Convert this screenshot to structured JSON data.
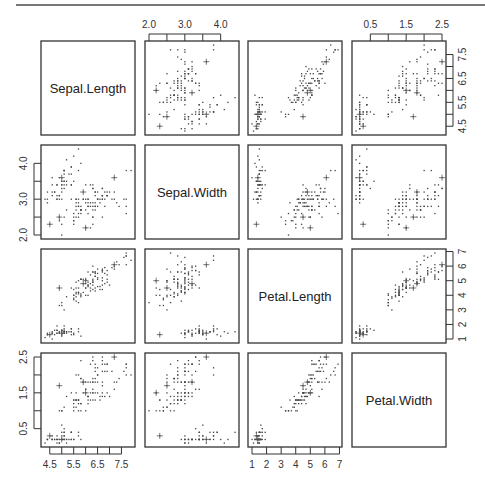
{
  "chart_data": {
    "type": "scatter",
    "title": "",
    "subtype": "scatterplot-matrix",
    "variables": [
      "Sepal.Length",
      "Sepal.Width",
      "Petal.Length",
      "Petal.Width"
    ],
    "ranges": {
      "Sepal.Length": [
        4.3,
        7.9
      ],
      "Sepal.Width": [
        2.0,
        4.4
      ],
      "Petal.Length": [
        1.0,
        6.9
      ],
      "Petal.Width": [
        0.1,
        2.5
      ]
    },
    "axes": {
      "top": [
        {
          "column": 1,
          "variable": "Sepal.Width",
          "ticks": [
            "2.0",
            "3.0",
            "4.0"
          ],
          "tick_values": [
            2.0,
            2.5,
            3.0,
            3.5,
            4.0
          ]
        },
        {
          "column": 3,
          "variable": "Petal.Width",
          "ticks": [
            "0.5",
            "1.5",
            "2.5"
          ],
          "tick_values": [
            0.5,
            1.0,
            1.5,
            2.0,
            2.5
          ]
        }
      ],
      "right": [
        {
          "row": 0,
          "variable": "Sepal.Length",
          "ticks": [
            "4.5",
            "5.5",
            "6.5",
            "7.5"
          ],
          "tick_values": [
            4.5,
            5.0,
            5.5,
            6.0,
            6.5,
            7.0,
            7.5
          ]
        },
        {
          "row": 2,
          "variable": "Petal.Length",
          "ticks": [
            "1",
            "2",
            "3",
            "4",
            "5",
            "6",
            "7"
          ],
          "tick_values": [
            1,
            2,
            3,
            4,
            5,
            6,
            7
          ]
        }
      ],
      "left": [
        {
          "row": 1,
          "variable": "Sepal.Width",
          "ticks": [
            "2.0",
            "3.0",
            "4.0"
          ],
          "tick_values": [
            2.0,
            2.5,
            3.0,
            3.5,
            4.0
          ]
        },
        {
          "row": 3,
          "variable": "Petal.Width",
          "ticks": [
            "0.5",
            "1.5",
            "2.5"
          ],
          "tick_values": [
            0.5,
            1.0,
            1.5,
            2.0,
            2.5
          ]
        }
      ],
      "bottom": [
        {
          "column": 0,
          "variable": "Sepal.Length",
          "ticks": [
            "4.5",
            "5.5",
            "6.5",
            "7.5"
          ],
          "tick_values": [
            4.5,
            5.0,
            5.5,
            6.0,
            6.5,
            7.0,
            7.5
          ]
        },
        {
          "column": 2,
          "variable": "Petal.Length",
          "ticks": [
            "1",
            "2",
            "3",
            "4",
            "5",
            "6",
            "7"
          ],
          "tick_values": [
            1,
            2,
            3,
            4,
            5,
            6,
            7
          ]
        }
      ]
    },
    "points": [
      [
        5.1,
        3.5,
        1.4,
        0.2
      ],
      [
        4.9,
        3.0,
        1.4,
        0.2
      ],
      [
        4.7,
        3.2,
        1.3,
        0.2
      ],
      [
        4.6,
        3.1,
        1.5,
        0.2
      ],
      [
        5.0,
        3.6,
        1.4,
        0.2
      ],
      [
        5.4,
        3.9,
        1.7,
        0.4
      ],
      [
        4.6,
        3.4,
        1.4,
        0.3
      ],
      [
        5.0,
        3.4,
        1.5,
        0.2
      ],
      [
        4.4,
        2.9,
        1.4,
        0.2
      ],
      [
        4.9,
        3.1,
        1.5,
        0.1
      ],
      [
        5.4,
        3.7,
        1.5,
        0.2
      ],
      [
        4.8,
        3.4,
        1.6,
        0.2
      ],
      [
        4.8,
        3.0,
        1.4,
        0.1
      ],
      [
        4.3,
        3.0,
        1.1,
        0.1
      ],
      [
        5.8,
        4.0,
        1.2,
        0.2
      ],
      [
        5.7,
        4.4,
        1.5,
        0.4
      ],
      [
        5.4,
        3.9,
        1.3,
        0.4
      ],
      [
        5.1,
        3.5,
        1.4,
        0.3
      ],
      [
        5.7,
        3.8,
        1.7,
        0.3
      ],
      [
        5.1,
        3.8,
        1.5,
        0.3
      ],
      [
        5.4,
        3.4,
        1.7,
        0.2
      ],
      [
        5.1,
        3.7,
        1.5,
        0.4
      ],
      [
        4.6,
        3.6,
        1.0,
        0.2
      ],
      [
        5.1,
        3.3,
        1.7,
        0.5
      ],
      [
        4.8,
        3.4,
        1.9,
        0.2
      ],
      [
        5.0,
        3.0,
        1.6,
        0.2
      ],
      [
        5.0,
        3.4,
        1.6,
        0.4
      ],
      [
        5.2,
        3.5,
        1.5,
        0.2
      ],
      [
        5.2,
        3.4,
        1.4,
        0.2
      ],
      [
        4.7,
        3.2,
        1.6,
        0.2
      ],
      [
        4.8,
        3.1,
        1.6,
        0.2
      ],
      [
        5.4,
        3.4,
        1.5,
        0.4
      ],
      [
        5.2,
        4.1,
        1.5,
        0.1
      ],
      [
        5.5,
        4.2,
        1.4,
        0.2
      ],
      [
        4.9,
        3.1,
        1.5,
        0.2
      ],
      [
        5.0,
        3.2,
        1.2,
        0.2
      ],
      [
        5.5,
        3.5,
        1.3,
        0.2
      ],
      [
        4.9,
        3.6,
        1.4,
        0.1
      ],
      [
        4.4,
        3.0,
        1.3,
        0.2
      ],
      [
        5.1,
        3.4,
        1.5,
        0.2
      ],
      [
        5.0,
        3.5,
        1.3,
        0.3
      ],
      [
        4.5,
        2.3,
        1.3,
        0.3
      ],
      [
        4.4,
        3.2,
        1.3,
        0.2
      ],
      [
        5.0,
        3.5,
        1.6,
        0.6
      ],
      [
        5.1,
        3.8,
        1.9,
        0.4
      ],
      [
        4.8,
        3.0,
        1.4,
        0.3
      ],
      [
        5.1,
        3.8,
        1.6,
        0.2
      ],
      [
        4.6,
        3.2,
        1.4,
        0.2
      ],
      [
        5.3,
        3.7,
        1.5,
        0.2
      ],
      [
        5.0,
        3.3,
        1.4,
        0.2
      ],
      [
        7.0,
        3.2,
        4.7,
        1.4
      ],
      [
        6.4,
        3.2,
        4.5,
        1.5
      ],
      [
        6.9,
        3.1,
        4.9,
        1.5
      ],
      [
        5.5,
        2.3,
        4.0,
        1.3
      ],
      [
        6.5,
        2.8,
        4.6,
        1.5
      ],
      [
        5.7,
        2.8,
        4.5,
        1.3
      ],
      [
        6.3,
        3.3,
        4.7,
        1.6
      ],
      [
        4.9,
        2.4,
        3.3,
        1.0
      ],
      [
        6.6,
        2.9,
        4.6,
        1.3
      ],
      [
        5.2,
        2.7,
        3.9,
        1.4
      ],
      [
        5.0,
        2.0,
        3.5,
        1.0
      ],
      [
        5.9,
        3.0,
        4.2,
        1.5
      ],
      [
        6.0,
        2.2,
        4.0,
        1.0
      ],
      [
        6.1,
        2.9,
        4.7,
        1.4
      ],
      [
        5.6,
        2.9,
        3.6,
        1.3
      ],
      [
        6.7,
        3.1,
        4.4,
        1.4
      ],
      [
        5.6,
        3.0,
        4.5,
        1.5
      ],
      [
        5.8,
        2.7,
        4.1,
        1.0
      ],
      [
        6.2,
        2.2,
        4.5,
        1.5
      ],
      [
        5.6,
        2.5,
        3.9,
        1.1
      ],
      [
        5.9,
        3.2,
        4.8,
        1.8
      ],
      [
        6.1,
        2.8,
        4.0,
        1.3
      ],
      [
        6.3,
        2.5,
        4.9,
        1.5
      ],
      [
        6.1,
        2.8,
        4.7,
        1.2
      ],
      [
        6.4,
        2.9,
        4.3,
        1.3
      ],
      [
        6.6,
        3.0,
        4.4,
        1.4
      ],
      [
        6.8,
        2.8,
        4.8,
        1.4
      ],
      [
        6.7,
        3.0,
        5.0,
        1.7
      ],
      [
        6.0,
        2.9,
        4.5,
        1.5
      ],
      [
        5.7,
        2.6,
        3.5,
        1.0
      ],
      [
        5.5,
        2.4,
        3.8,
        1.1
      ],
      [
        5.5,
        2.4,
        3.7,
        1.0
      ],
      [
        5.8,
        2.7,
        3.9,
        1.2
      ],
      [
        6.0,
        2.7,
        5.1,
        1.6
      ],
      [
        5.4,
        3.0,
        4.5,
        1.5
      ],
      [
        6.0,
        3.4,
        4.5,
        1.6
      ],
      [
        6.7,
        3.1,
        4.7,
        1.5
      ],
      [
        6.3,
        2.3,
        4.4,
        1.3
      ],
      [
        5.6,
        3.0,
        4.1,
        1.3
      ],
      [
        5.5,
        2.5,
        4.0,
        1.3
      ],
      [
        5.5,
        2.6,
        4.4,
        1.2
      ],
      [
        6.1,
        3.0,
        4.6,
        1.4
      ],
      [
        5.8,
        2.6,
        4.0,
        1.2
      ],
      [
        5.0,
        2.3,
        3.3,
        1.0
      ],
      [
        5.6,
        2.7,
        4.2,
        1.3
      ],
      [
        5.7,
        3.0,
        4.2,
        1.2
      ],
      [
        5.7,
        2.9,
        4.2,
        1.3
      ],
      [
        6.2,
        2.9,
        4.3,
        1.3
      ],
      [
        5.1,
        2.5,
        3.0,
        1.1
      ],
      [
        5.7,
        2.8,
        4.1,
        1.3
      ],
      [
        6.3,
        3.3,
        6.0,
        2.5
      ],
      [
        5.8,
        2.7,
        5.1,
        1.9
      ],
      [
        7.1,
        3.0,
        5.9,
        2.1
      ],
      [
        6.3,
        2.9,
        5.6,
        1.8
      ],
      [
        6.5,
        3.0,
        5.8,
        2.2
      ],
      [
        7.6,
        3.0,
        6.6,
        2.1
      ],
      [
        4.9,
        2.5,
        4.5,
        1.7
      ],
      [
        7.3,
        2.9,
        6.3,
        1.8
      ],
      [
        6.7,
        2.5,
        5.8,
        1.8
      ],
      [
        7.2,
        3.6,
        6.1,
        2.5
      ],
      [
        6.5,
        3.2,
        5.1,
        2.0
      ],
      [
        6.4,
        2.7,
        5.3,
        1.9
      ],
      [
        6.8,
        3.0,
        5.5,
        2.1
      ],
      [
        5.7,
        2.5,
        5.0,
        2.0
      ],
      [
        5.8,
        2.8,
        5.1,
        2.4
      ],
      [
        6.4,
        3.2,
        5.3,
        2.3
      ],
      [
        6.5,
        3.0,
        5.5,
        1.8
      ],
      [
        7.7,
        3.8,
        6.7,
        2.2
      ],
      [
        7.7,
        2.6,
        6.9,
        2.3
      ],
      [
        6.0,
        2.2,
        5.0,
        1.5
      ],
      [
        6.9,
        3.2,
        5.7,
        2.3
      ],
      [
        5.6,
        2.8,
        4.9,
        2.0
      ],
      [
        7.7,
        2.8,
        6.7,
        2.0
      ],
      [
        6.3,
        2.7,
        4.9,
        1.8
      ],
      [
        6.7,
        3.3,
        5.7,
        2.1
      ],
      [
        7.2,
        3.2,
        6.0,
        1.8
      ],
      [
        6.2,
        2.8,
        4.8,
        1.8
      ],
      [
        6.1,
        3.0,
        4.9,
        1.8
      ],
      [
        6.4,
        2.8,
        5.6,
        2.1
      ],
      [
        7.2,
        3.0,
        5.8,
        1.6
      ],
      [
        7.4,
        2.8,
        6.1,
        1.9
      ],
      [
        7.9,
        3.8,
        6.4,
        2.0
      ],
      [
        6.4,
        2.8,
        5.6,
        2.2
      ],
      [
        6.3,
        2.8,
        5.1,
        1.5
      ],
      [
        6.1,
        2.6,
        5.6,
        1.4
      ],
      [
        7.7,
        3.0,
        6.1,
        2.3
      ],
      [
        6.3,
        3.4,
        5.6,
        2.4
      ],
      [
        6.4,
        3.1,
        5.5,
        1.8
      ],
      [
        6.0,
        3.0,
        4.8,
        1.8
      ],
      [
        6.9,
        3.1,
        5.4,
        2.1
      ],
      [
        6.7,
        3.1,
        5.6,
        2.4
      ],
      [
        6.9,
        3.1,
        5.1,
        2.3
      ],
      [
        5.8,
        2.7,
        5.1,
        1.9
      ],
      [
        6.8,
        3.2,
        5.9,
        2.3
      ],
      [
        6.7,
        3.3,
        5.7,
        2.5
      ],
      [
        6.7,
        3.0,
        5.2,
        2.3
      ],
      [
        6.3,
        2.5,
        5.0,
        1.9
      ],
      [
        6.5,
        3.0,
        5.2,
        2.0
      ],
      [
        6.2,
        3.4,
        5.4,
        2.3
      ],
      [
        5.9,
        3.0,
        5.1,
        1.8
      ]
    ],
    "highlighted_points_plus_marker": [
      [
        5.0,
        3.6,
        1.4,
        0.2
      ],
      [
        4.5,
        2.3,
        1.3,
        0.3
      ],
      [
        7.2,
        3.6,
        6.1,
        2.5
      ],
      [
        6.0,
        2.2,
        5.0,
        1.5
      ],
      [
        4.9,
        2.5,
        4.5,
        1.7
      ],
      [
        5.9,
        3.2,
        4.8,
        1.8
      ]
    ],
    "grid": false,
    "legend": null
  },
  "panels": {
    "diag_labels": [
      "Sepal.Length",
      "Sepal.Width",
      "Petal.Length",
      "Petal.Width"
    ]
  }
}
